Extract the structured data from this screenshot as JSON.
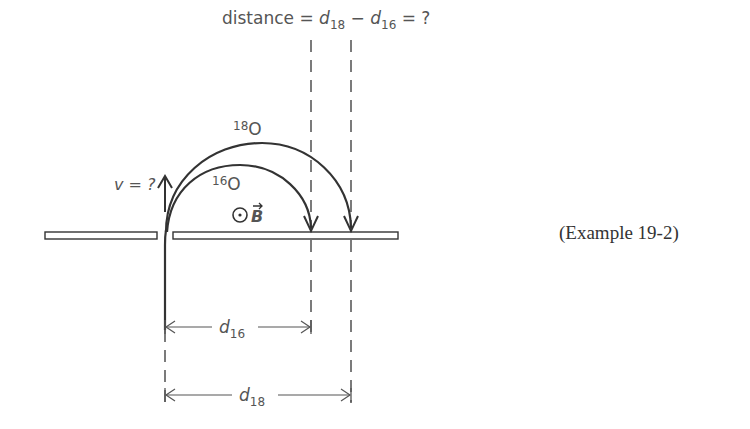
{
  "title": {
    "prefix": "distance = ",
    "d": "d",
    "sub18": "18",
    "minus": " − ",
    "sub16": "16",
    "suffix": " = ?"
  },
  "velocity_label": "v = ?",
  "isotopes": {
    "heavy": {
      "mass": "18",
      "symbol": "O"
    },
    "light": {
      "mass": "16",
      "symbol": "O"
    }
  },
  "field_label": "B",
  "dimensions": {
    "d16": {
      "symbol": "d",
      "sub": "16"
    },
    "d18": {
      "symbol": "d",
      "sub": "18"
    }
  },
  "caption": "(Example 19-2)",
  "colors": {
    "ink": "#333333",
    "pencil": "#555555",
    "dashed": "#444444"
  }
}
